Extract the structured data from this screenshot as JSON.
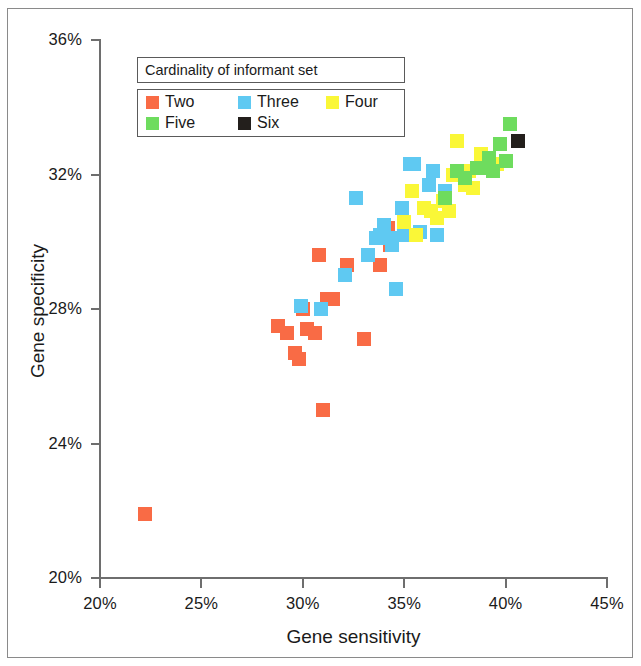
{
  "chart_data": {
    "type": "scatter",
    "title": "",
    "xlabel": "Gene sensitivity",
    "ylabel": "Gene specificity",
    "xlim": [
      20,
      45
    ],
    "ylim": [
      20,
      36
    ],
    "xticks": [
      "20%",
      "25%",
      "30%",
      "35%",
      "40%",
      "45%"
    ],
    "yticks": [
      "20%",
      "24%",
      "28%",
      "32%",
      "36%"
    ],
    "xtick_values": [
      20,
      25,
      30,
      35,
      40,
      45
    ],
    "ytick_values": [
      20,
      24,
      28,
      32,
      36
    ],
    "grid": false,
    "legend": {
      "title": "Cardinality of informant set",
      "position": "upper-left-inside",
      "entries": [
        {
          "label": "Two",
          "color": "#f96b45"
        },
        {
          "label": "Three",
          "color": "#5fc9f2"
        },
        {
          "label": "Four",
          "color": "#faf737"
        },
        {
          "label": "Five",
          "color": "#6edc5e"
        },
        {
          "label": "Six",
          "color": "#231f1c"
        }
      ]
    },
    "series": [
      {
        "name": "Two",
        "color": "#f96b45",
        "points": [
          [
            22.2,
            21.9
          ],
          [
            28.8,
            27.5
          ],
          [
            29.2,
            27.3
          ],
          [
            29.6,
            26.7
          ],
          [
            29.8,
            26.5
          ],
          [
            30.0,
            28.0
          ],
          [
            30.2,
            27.4
          ],
          [
            30.6,
            27.3
          ],
          [
            30.8,
            29.6
          ],
          [
            31.0,
            25.0
          ],
          [
            31.2,
            28.3
          ],
          [
            31.5,
            28.3
          ],
          [
            32.2,
            29.3
          ],
          [
            33.0,
            27.1
          ],
          [
            33.8,
            29.3
          ],
          [
            34.2,
            30.4
          ],
          [
            34.3,
            29.9
          ]
        ]
      },
      {
        "name": "Three",
        "color": "#5fc9f2",
        "points": [
          [
            29.9,
            28.1
          ],
          [
            30.9,
            28.0
          ],
          [
            32.1,
            29.0
          ],
          [
            32.6,
            31.3
          ],
          [
            33.2,
            29.6
          ],
          [
            33.6,
            30.1
          ],
          [
            33.8,
            30.2
          ],
          [
            34.0,
            30.5
          ],
          [
            34.3,
            30.1
          ],
          [
            34.4,
            29.9
          ],
          [
            34.6,
            28.6
          ],
          [
            34.9,
            31.0
          ],
          [
            35.0,
            30.2
          ],
          [
            35.3,
            32.3
          ],
          [
            35.5,
            32.3
          ],
          [
            35.8,
            30.3
          ],
          [
            36.2,
            31.7
          ],
          [
            36.4,
            32.1
          ],
          [
            36.6,
            30.2
          ],
          [
            37.0,
            31.5
          ],
          [
            38.0,
            32.0
          ]
        ]
      },
      {
        "name": "Four",
        "color": "#faf737",
        "points": [
          [
            35.0,
            30.6
          ],
          [
            35.4,
            31.5
          ],
          [
            35.6,
            30.2
          ],
          [
            36.0,
            31.0
          ],
          [
            36.3,
            30.9
          ],
          [
            36.6,
            30.7
          ],
          [
            36.9,
            31.2
          ],
          [
            37.2,
            30.9
          ],
          [
            37.4,
            32.0
          ],
          [
            37.6,
            33.0
          ],
          [
            37.8,
            32.1
          ],
          [
            38.0,
            31.7
          ],
          [
            38.2,
            32.1
          ],
          [
            38.4,
            31.6
          ],
          [
            38.8,
            32.6
          ],
          [
            39.2,
            32.4
          ],
          [
            39.6,
            32.3
          ]
        ]
      },
      {
        "name": "Five",
        "color": "#6edc5e",
        "points": [
          [
            37.0,
            31.3
          ],
          [
            37.6,
            32.1
          ],
          [
            38.0,
            31.9
          ],
          [
            38.6,
            32.2
          ],
          [
            39.0,
            32.2
          ],
          [
            39.2,
            32.5
          ],
          [
            39.4,
            32.1
          ],
          [
            39.7,
            32.9
          ],
          [
            40.0,
            32.4
          ],
          [
            40.2,
            33.5
          ]
        ]
      },
      {
        "name": "Six",
        "color": "#231f1c",
        "points": [
          [
            40.6,
            33.0
          ]
        ]
      }
    ]
  }
}
